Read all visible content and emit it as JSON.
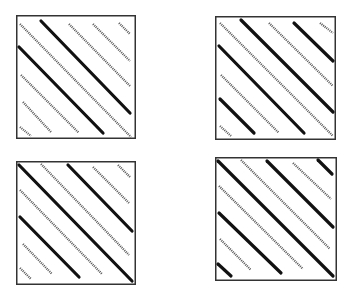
{
  "figure": {
    "colors": {
      "background": "#ffffff",
      "stroke": "#111111",
      "dotted": "#555555",
      "frame": "#333333"
    },
    "panels": [
      {
        "id": "top-left",
        "x": 16,
        "y": 15,
        "w": 120,
        "h": 124,
        "lines": [
          {
            "style": "dotted",
            "x1": 4,
            "y1": 9,
            "x2": 115,
            "y2": 122
          },
          {
            "style": "solid",
            "x1": 25,
            "y1": 6,
            "x2": 114,
            "y2": 98
          },
          {
            "style": "dotted",
            "x1": 53,
            "y1": 9,
            "x2": 114,
            "y2": 71
          },
          {
            "style": "dotted",
            "x1": 77,
            "y1": 9,
            "x2": 114,
            "y2": 46
          },
          {
            "style": "dotted",
            "x1": 103,
            "y1": 8,
            "x2": 114,
            "y2": 19
          },
          {
            "style": "solid",
            "x1": 3,
            "y1": 32,
            "x2": 87,
            "y2": 118
          },
          {
            "style": "dotted",
            "x1": 5,
            "y1": 60,
            "x2": 63,
            "y2": 118
          },
          {
            "style": "dotted",
            "x1": 7,
            "y1": 87,
            "x2": 35,
            "y2": 117
          },
          {
            "style": "dotted",
            "x1": 4,
            "y1": 112,
            "x2": 15,
            "y2": 121
          }
        ]
      },
      {
        "id": "top-right",
        "x": 215,
        "y": 16,
        "w": 121,
        "h": 124,
        "lines": [
          {
            "style": "dotted",
            "x1": 5,
            "y1": 7,
            "x2": 118,
            "y2": 120
          },
          {
            "style": "solid",
            "x1": 26,
            "y1": 4,
            "x2": 118,
            "y2": 96
          },
          {
            "style": "dotted",
            "x1": 54,
            "y1": 7,
            "x2": 118,
            "y2": 70
          },
          {
            "style": "solid",
            "x1": 79,
            "y1": 7,
            "x2": 118,
            "y2": 45
          },
          {
            "style": "dotted",
            "x1": 105,
            "y1": 7,
            "x2": 118,
            "y2": 17
          },
          {
            "style": "solid",
            "x1": 4,
            "y1": 30,
            "x2": 89,
            "y2": 117
          },
          {
            "style": "dotted",
            "x1": 6,
            "y1": 59,
            "x2": 64,
            "y2": 117
          },
          {
            "style": "solid",
            "x1": 5,
            "y1": 83,
            "x2": 39,
            "y2": 117
          },
          {
            "style": "dotted",
            "x1": 5,
            "y1": 110,
            "x2": 16,
            "y2": 120
          }
        ]
      },
      {
        "id": "bottom-left",
        "x": 16,
        "y": 161,
        "w": 120,
        "h": 124,
        "lines": [
          {
            "style": "solid",
            "x1": 3,
            "y1": 4,
            "x2": 116,
            "y2": 120
          },
          {
            "style": "dotted",
            "x1": 25,
            "y1": 3,
            "x2": 113,
            "y2": 94
          },
          {
            "style": "solid",
            "x1": 52,
            "y1": 4,
            "x2": 116,
            "y2": 70
          },
          {
            "style": "dotted",
            "x1": 77,
            "y1": 6,
            "x2": 113,
            "y2": 42
          },
          {
            "style": "dotted",
            "x1": 102,
            "y1": 4,
            "x2": 114,
            "y2": 16
          },
          {
            "style": "dotted",
            "x1": 4,
            "y1": 29,
            "x2": 86,
            "y2": 113
          },
          {
            "style": "solid",
            "x1": 4,
            "y1": 56,
            "x2": 63,
            "y2": 116
          },
          {
            "style": "dotted",
            "x1": 7,
            "y1": 83,
            "x2": 36,
            "y2": 113
          },
          {
            "style": "dotted",
            "x1": 4,
            "y1": 107,
            "x2": 15,
            "y2": 118
          }
        ]
      },
      {
        "id": "bottom-right",
        "x": 215,
        "y": 157,
        "w": 122,
        "h": 124,
        "lines": [
          {
            "style": "solid",
            "x1": 3,
            "y1": 4,
            "x2": 118,
            "y2": 119
          },
          {
            "style": "dotted",
            "x1": 26,
            "y1": 3,
            "x2": 115,
            "y2": 92
          },
          {
            "style": "solid",
            "x1": 52,
            "y1": 4,
            "x2": 118,
            "y2": 70
          },
          {
            "style": "dotted",
            "x1": 78,
            "y1": 6,
            "x2": 116,
            "y2": 42
          },
          {
            "style": "solid",
            "x1": 103,
            "y1": 3,
            "x2": 117,
            "y2": 17
          },
          {
            "style": "dotted",
            "x1": 4,
            "y1": 29,
            "x2": 88,
            "y2": 112
          },
          {
            "style": "solid",
            "x1": 4,
            "y1": 56,
            "x2": 66,
            "y2": 116
          },
          {
            "style": "dotted",
            "x1": 5,
            "y1": 82,
            "x2": 36,
            "y2": 113
          },
          {
            "style": "solid",
            "x1": 3,
            "y1": 107,
            "x2": 16,
            "y2": 119
          }
        ]
      }
    ]
  }
}
